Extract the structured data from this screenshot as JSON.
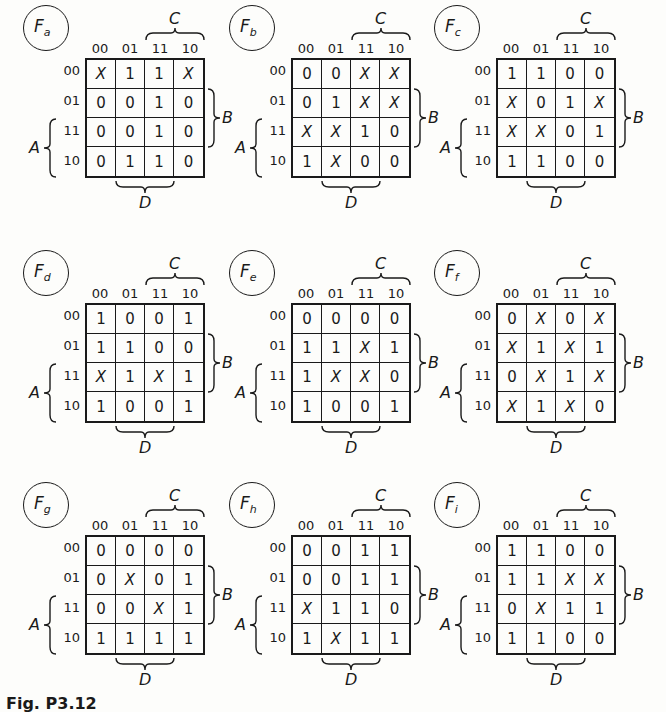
{
  "figure": {
    "caption": "Fig. P3.12",
    "column_labels": [
      "00",
      "01",
      "11",
      "10"
    ],
    "row_labels": [
      "00",
      "01",
      "11",
      "10"
    ],
    "variables": {
      "top": "C",
      "right": "B",
      "left": "A",
      "bottom": "D"
    },
    "maps": [
      {
        "name": "F",
        "sub": "a",
        "cells": [
          [
            "X",
            "1",
            "1",
            "X"
          ],
          [
            "0",
            "0",
            "1",
            "0"
          ],
          [
            "0",
            "0",
            "1",
            "0"
          ],
          [
            "0",
            "1",
            "1",
            "0"
          ]
        ]
      },
      {
        "name": "F",
        "sub": "b",
        "cells": [
          [
            "0",
            "0",
            "X",
            "X"
          ],
          [
            "0",
            "1",
            "X",
            "X"
          ],
          [
            "X",
            "X",
            "1",
            "0"
          ],
          [
            "1",
            "X",
            "0",
            "0"
          ]
        ]
      },
      {
        "name": "F",
        "sub": "c",
        "cells": [
          [
            "1",
            "1",
            "0",
            "0"
          ],
          [
            "X",
            "0",
            "1",
            "X"
          ],
          [
            "X",
            "X",
            "0",
            "1"
          ],
          [
            "1",
            "1",
            "0",
            "0"
          ]
        ]
      },
      {
        "name": "F",
        "sub": "d",
        "cells": [
          [
            "1",
            "0",
            "0",
            "1"
          ],
          [
            "1",
            "1",
            "0",
            "0"
          ],
          [
            "X",
            "1",
            "X",
            "1"
          ],
          [
            "1",
            "0",
            "0",
            "1"
          ]
        ]
      },
      {
        "name": "F",
        "sub": "e",
        "cells": [
          [
            "0",
            "0",
            "0",
            "0"
          ],
          [
            "1",
            "1",
            "X",
            "1"
          ],
          [
            "1",
            "X",
            "X",
            "0"
          ],
          [
            "1",
            "0",
            "0",
            "1"
          ]
        ]
      },
      {
        "name": "F",
        "sub": "f",
        "cells": [
          [
            "0",
            "X",
            "0",
            "X"
          ],
          [
            "X",
            "1",
            "X",
            "1"
          ],
          [
            "0",
            "X",
            "1",
            "X"
          ],
          [
            "X",
            "1",
            "X",
            "0"
          ]
        ]
      },
      {
        "name": "F",
        "sub": "g",
        "cells": [
          [
            "0",
            "0",
            "0",
            "0"
          ],
          [
            "0",
            "X",
            "0",
            "1"
          ],
          [
            "0",
            "0",
            "X",
            "1"
          ],
          [
            "1",
            "1",
            "1",
            "1"
          ]
        ]
      },
      {
        "name": "F",
        "sub": "h",
        "cells": [
          [
            "0",
            "0",
            "1",
            "1"
          ],
          [
            "0",
            "0",
            "1",
            "1"
          ],
          [
            "X",
            "1",
            "1",
            "0"
          ],
          [
            "1",
            "X",
            "1",
            "1"
          ]
        ]
      },
      {
        "name": "F",
        "sub": "i",
        "cells": [
          [
            "1",
            "1",
            "0",
            "0"
          ],
          [
            "1",
            "1",
            "X",
            "X"
          ],
          [
            "0",
            "X",
            "1",
            "1"
          ],
          [
            "1",
            "1",
            "0",
            "0"
          ]
        ]
      }
    ]
  }
}
